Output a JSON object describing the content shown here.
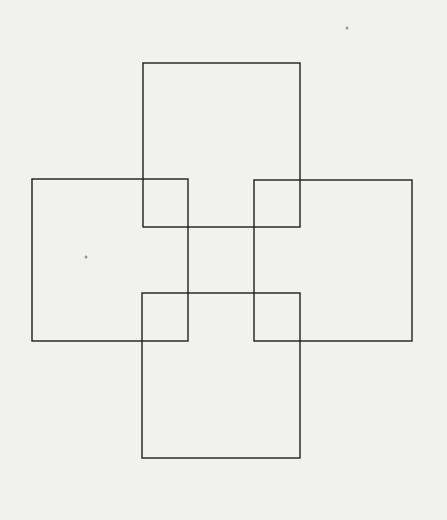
{
  "diagram": {
    "type": "overlapping-squares",
    "background": "#f1f1f0",
    "stroke_color": "#1e1e1e",
    "stroke_width": 1.4,
    "shapes": [
      {
        "name": "top-square",
        "x": 143,
        "y": 63,
        "w": 157,
        "h": 164
      },
      {
        "name": "left-square",
        "x": 32,
        "y": 179,
        "w": 156,
        "h": 162
      },
      {
        "name": "right-square",
        "x": 254,
        "y": 180,
        "w": 158,
        "h": 161
      },
      {
        "name": "bottom-square",
        "x": 142,
        "y": 293,
        "w": 158,
        "h": 165
      }
    ],
    "specks": [
      {
        "x": 86,
        "y": 257,
        "r": 1.5
      },
      {
        "x": 347,
        "y": 28,
        "r": 1.5
      }
    ]
  }
}
